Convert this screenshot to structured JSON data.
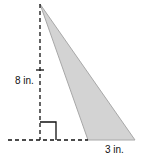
{
  "diagram": {
    "shape": "obtuse triangle",
    "height_label": "8 in.",
    "base_label": "3 in.",
    "fill_color": "#d3d3d3",
    "stroke_color": "#a8a8a8",
    "line_color": "#111111",
    "right_angle_marker": true
  }
}
